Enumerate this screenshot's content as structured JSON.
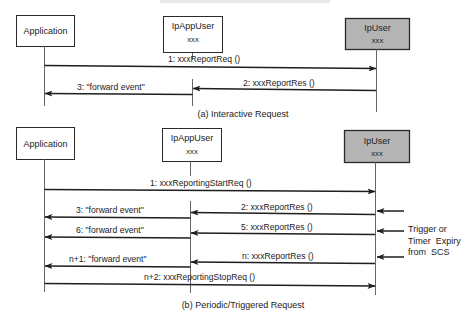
{
  "diagram_a": {
    "caption": "(a) Interactive Request",
    "actors": {
      "application": {
        "name": "Application"
      },
      "ipappuser": {
        "name": "IpAppUser",
        "sub": "xxx"
      },
      "ipuser": {
        "name": "IpUser",
        "sub": "xxx",
        "fill": "#b4b4b4"
      }
    },
    "messages": [
      {
        "label": "1: xxxReportReq ()",
        "from": "Application",
        "to": "IpUser"
      },
      {
        "label": "2: xxxReportRes ()",
        "from": "IpUser",
        "to": "IpAppUser"
      },
      {
        "label": "3: \"forward event\"",
        "from": "IpAppUser",
        "to": "Application"
      }
    ]
  },
  "diagram_b": {
    "caption": "(b) Periodic/Triggered Request",
    "actors": {
      "application": {
        "name": "Application"
      },
      "ipappuser": {
        "name": "IpAppUser",
        "sub": "xxx"
      },
      "ipuser": {
        "name": "IpUser",
        "sub": "xxx",
        "fill": "#b4b4b4"
      }
    },
    "messages": [
      {
        "label": "1: xxxReportingStartReq  ()",
        "from": "Application",
        "to": "IpUser"
      },
      {
        "label": "2: xxxReportRes ()",
        "from": "IpUser",
        "to": "IpAppUser"
      },
      {
        "label": "3: \"forward event\"",
        "from": "IpAppUser",
        "to": "Application"
      },
      {
        "label": "5: xxxReportRes ()",
        "from": "IpUser",
        "to": "IpAppUser"
      },
      {
        "label": "6: \"forward event\"",
        "from": "IpAppUser",
        "to": "Application"
      },
      {
        "label": "n: xxxReportRes ()",
        "from": "IpUser",
        "to": "IpAppUser"
      },
      {
        "label": "n+1: \"forward event\"",
        "from": "IpAppUser",
        "to": "Application"
      },
      {
        "label": "n+2: xxxReportingStopReq  ()",
        "from": "Application",
        "to": "IpUser"
      }
    ],
    "trigger_note": {
      "lines": [
        "Trigger or",
        "Timer  Expiry",
        "from  SCS"
      ]
    }
  }
}
